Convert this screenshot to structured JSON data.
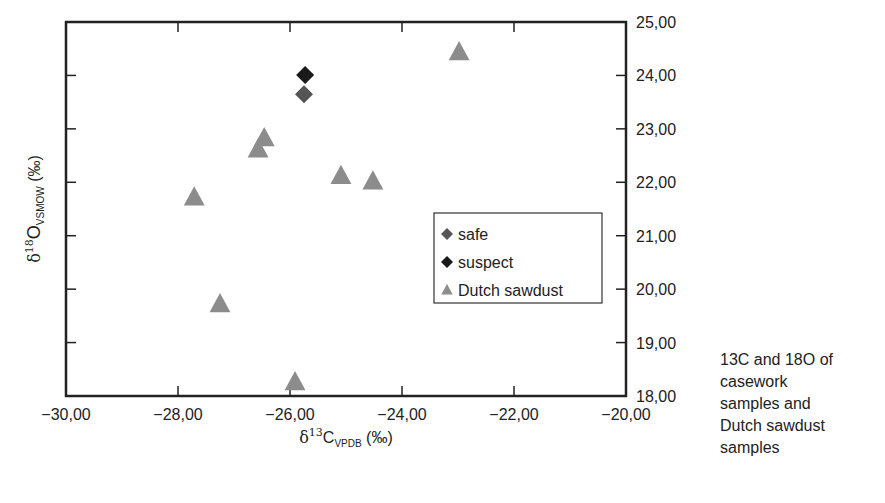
{
  "chart_data": {
    "type": "scatter",
    "title": "",
    "xlabel": "δ13C VPDB (‰)",
    "ylabel": "δ18O VSMOW (‰)",
    "xlim": [
      -30,
      -20
    ],
    "ylim": [
      18,
      25
    ],
    "x_ticks": [
      -30,
      -28,
      -26,
      -24,
      -22,
      -20
    ],
    "x_tick_labels": [
      "−30,00",
      "−28,00",
      "−26,00",
      "−24,00",
      "−22,00",
      "−20,00"
    ],
    "y_ticks": [
      18,
      19,
      20,
      21,
      22,
      23,
      24,
      25
    ],
    "y_tick_labels": [
      "18,00",
      "19,00",
      "20,00",
      "21,00",
      "22,00",
      "23,00",
      "24,00",
      "25,00"
    ],
    "y_axis_side": "right",
    "grid": false,
    "legend_position": "inside-right",
    "series": [
      {
        "name": "safe",
        "marker": "diamond",
        "color": "#555555",
        "points": [
          {
            "x": -25.75,
            "y": 23.65
          }
        ]
      },
      {
        "name": "suspect",
        "marker": "diamond",
        "color": "#1a1a1a",
        "points": [
          {
            "x": -25.73,
            "y": 24.01
          }
        ]
      },
      {
        "name": "Dutch sawdust",
        "marker": "triangle",
        "color": "#8c8c8c",
        "points": [
          {
            "x": -27.71,
            "y": 21.72
          },
          {
            "x": -27.25,
            "y": 19.72
          },
          {
            "x": -26.57,
            "y": 22.62
          },
          {
            "x": -26.46,
            "y": 22.83
          },
          {
            "x": -25.91,
            "y": 18.26
          },
          {
            "x": -25.09,
            "y": 22.12
          },
          {
            "x": -24.52,
            "y": 22.02
          },
          {
            "x": -22.98,
            "y": 24.44
          }
        ]
      }
    ]
  },
  "axis_titles": {
    "x_prefix": "δ",
    "x_sup": "13",
    "x_main": "C",
    "x_sub": "VPDB",
    "x_unit": " (‰)",
    "y_prefix": "δ",
    "y_sup": "18",
    "y_main": "O",
    "y_sub": "VSMOW",
    "y_unit": " (‰)"
  },
  "caption": "13C and 18O of\ncasework\nsamples and\nDutch sawdust\nsamples"
}
